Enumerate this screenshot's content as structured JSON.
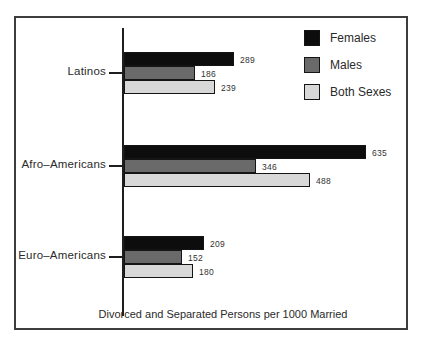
{
  "chart_data": {
    "type": "bar",
    "orientation": "horizontal",
    "title": "Divorced and Separated Persons per 1000 Married",
    "categories": [
      "Latinos",
      "Afro–Americans",
      "Euro–Americans"
    ],
    "series": [
      {
        "name": "Females",
        "color": "#0d0d0d",
        "values": [
          289,
          635,
          209
        ]
      },
      {
        "name": "Males",
        "color": "#6a6a6a",
        "values": [
          186,
          346,
          152
        ]
      },
      {
        "name": "Both Sexes",
        "color": "#d8d8d8",
        "values": [
          239,
          488,
          180
        ]
      }
    ],
    "value_labels_shown": true,
    "legend_position": "top-right",
    "grid": "off",
    "x_axis_tick_labels": "none"
  },
  "colors": {
    "frame_border": "#3d3d3d",
    "axis_line": "#1e1e1e",
    "text": "#2a2a2a"
  }
}
